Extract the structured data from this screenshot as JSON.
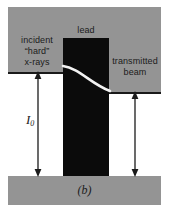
{
  "figure": {
    "caption": "(b)",
    "width": 169,
    "height": 213,
    "background": "#ffffff"
  },
  "colors": {
    "slab_gray": "#949494",
    "lead_black": "#0b0b0b",
    "curve_white": "#f2f2f2",
    "ink": "#1b1b1b"
  },
  "labels": {
    "incident": "incident\n“hard”\nx-rays",
    "lead": "lead",
    "transmitted": "transmitted\nbeam",
    "intensity_symbol": "I",
    "intensity_subscript": "0"
  },
  "elements": {
    "top_slab": "absorber-slab-upper",
    "bottom_slab": "absorber-slab-lower",
    "lead_block": "lead-attenuator-block",
    "attenuation_curve": "beam-attenuation-curve",
    "incident_arrow": "incident-intensity-arrow",
    "transmitted_arrow": "transmitted-intensity-arrow"
  }
}
